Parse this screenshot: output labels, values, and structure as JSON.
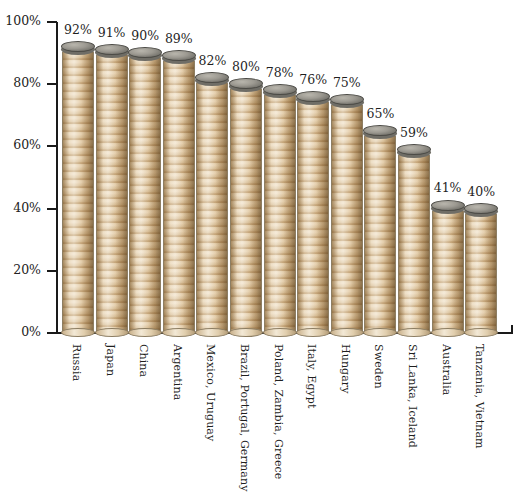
{
  "chart_data": {
    "type": "bar",
    "title": "",
    "subtitle": "",
    "xlabel": "",
    "ylabel": "",
    "ylim": [
      0,
      100
    ],
    "y_tick_labels": [
      "0%",
      "20%",
      "40%",
      "60%",
      "80%",
      "100%"
    ],
    "y_ticks": [
      0,
      20,
      40,
      60,
      80,
      100
    ],
    "grid": false,
    "legend": false,
    "value_suffix": "%",
    "categories": [
      "Russia",
      "Japan",
      "China",
      "Argentina",
      "Mexico, Uruguay",
      "Brazil, Portugal, Germany",
      "Poland, Zambia, Greece",
      "Italy, Egypt",
      "Hungary",
      "Sweden",
      "Sri Lanka, Iceland",
      "Australia",
      "Tanzania, Vietnam"
    ],
    "values": [
      92,
      91,
      90,
      89,
      82,
      80,
      78,
      76,
      75,
      65,
      59,
      41,
      40
    ],
    "value_labels": [
      "92%",
      "91%",
      "90%",
      "89%",
      "82%",
      "80%",
      "78%",
      "76%",
      "75%",
      "65%",
      "59%",
      "41%",
      "40%"
    ],
    "bar_style": "stacked-coins",
    "colors": {
      "coin_body": "#eddfc8",
      "coin_edge": "#8d7e63",
      "coin_top": "#8a8880",
      "axis": "#1a1a1a",
      "text": "#1f1f1f",
      "background": "#ffffff"
    }
  }
}
